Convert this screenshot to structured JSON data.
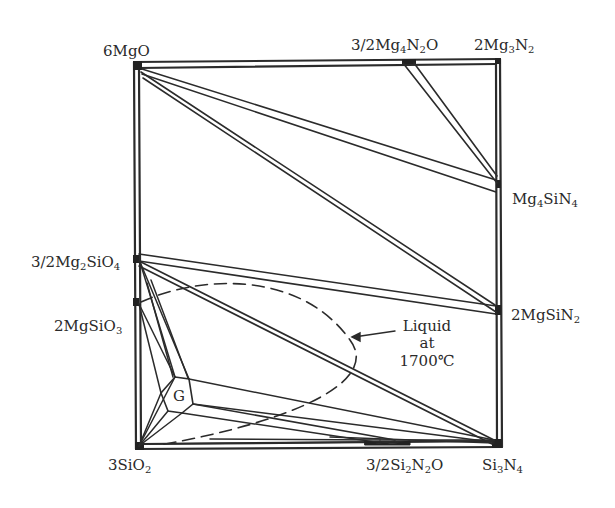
{
  "diagram": {
    "type": "phase_diagram",
    "system": "Mg-Si-O-N (reciprocal square)",
    "corners": {
      "top_left": "6MgO",
      "top_right": "2Mg3N2",
      "bottom_left": "3SiO2",
      "bottom_right": "Si3N4"
    },
    "labels": [
      {
        "id": "mgo",
        "parts": [
          [
            "6MgO",
            ""
          ]
        ]
      },
      {
        "id": "mg4n2o",
        "parts": [
          [
            "3/2Mg",
            ""
          ],
          [
            "4",
            "sub"
          ],
          [
            "N",
            ""
          ],
          [
            "2",
            "sub"
          ],
          [
            "O",
            ""
          ]
        ]
      },
      {
        "id": "mg3n2",
        "parts": [
          [
            "2Mg",
            ""
          ],
          [
            "3",
            "sub"
          ],
          [
            "N",
            ""
          ],
          [
            "2",
            "sub"
          ]
        ]
      },
      {
        "id": "mg4sin4",
        "parts": [
          [
            "Mg",
            ""
          ],
          [
            "4",
            "sub"
          ],
          [
            "SiN",
            ""
          ],
          [
            "4",
            "sub"
          ]
        ]
      },
      {
        "id": "mg2sio4",
        "parts": [
          [
            "3/2Mg",
            ""
          ],
          [
            "2",
            "sub"
          ],
          [
            "SiO",
            ""
          ],
          [
            "4",
            "sub"
          ]
        ]
      },
      {
        "id": "mgsin2",
        "parts": [
          [
            "2MgSiN",
            ""
          ],
          [
            "2",
            "sub"
          ]
        ]
      },
      {
        "id": "mgsio3",
        "parts": [
          [
            "2MgSiO",
            ""
          ],
          [
            "3",
            "sub"
          ]
        ]
      },
      {
        "id": "sio2",
        "parts": [
          [
            "3SiO",
            ""
          ],
          [
            "2",
            "sub"
          ]
        ]
      },
      {
        "id": "si2n2o",
        "parts": [
          [
            "3/2Si",
            ""
          ],
          [
            "2",
            "sub"
          ],
          [
            "N",
            ""
          ],
          [
            "2",
            "sub"
          ],
          [
            "O",
            ""
          ]
        ]
      },
      {
        "id": "si3n4",
        "parts": [
          [
            "Si",
            ""
          ],
          [
            "3",
            "sub"
          ],
          [
            "N",
            ""
          ],
          [
            "4",
            "sub"
          ]
        ]
      }
    ],
    "glass_region_label": "G",
    "liquid_annotation": {
      "line1": "Liquid",
      "line2": "at",
      "line3": "1700℃"
    },
    "compatibility_lines": [
      "6MgO - 3/2Mg4N2O",
      "6MgO - Mg4SiN4",
      "6MgO - 2MgSiN2",
      "3/2Mg4N2O - Mg4SiN4",
      "3/2Mg2SiO4 - 2MgSiN2",
      "3/2Mg2SiO4 - Si3N4",
      "G - Si3N4",
      "G - 3/2Si2N2O",
      "3SiO2 - Si3N4"
    ],
    "colors": {
      "line": "#2b2b2b",
      "background": "#ffffff"
    }
  }
}
